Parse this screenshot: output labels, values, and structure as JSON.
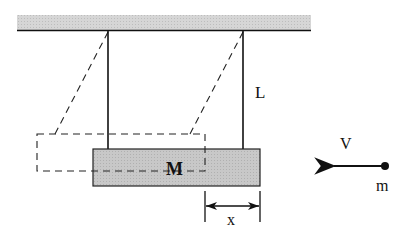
{
  "diagram": {
    "labels": {
      "block_mass": "M",
      "string_length": "L",
      "velocity": "V",
      "bullet_mass": "m",
      "displacement": "x"
    },
    "colors": {
      "ceiling_fill": "#d4d4d4",
      "block_fill": "#c6c6c6",
      "line": "#111111"
    },
    "elements": {
      "ceiling": {
        "x": 17,
        "y": 15,
        "w": 294,
        "h": 16
      },
      "left_string_x": 108,
      "right_string_x": 243,
      "block_rest": {
        "x": 93,
        "y": 149,
        "w": 167,
        "h": 37
      },
      "block_swung": {
        "x": 37,
        "y": 134,
        "w": 168,
        "h": 37
      },
      "bullet": {
        "cx": 385,
        "cy": 166
      },
      "displacement_range": [
        205,
        260
      ]
    }
  }
}
